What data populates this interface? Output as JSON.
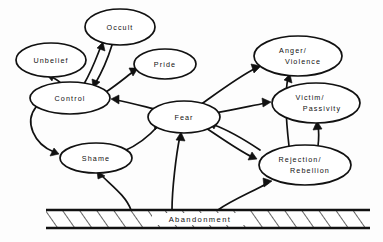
{
  "diagram": {
    "type": "directed-graph",
    "colors": {
      "stroke": "#111111",
      "fill": "#ffffff",
      "background": "#fdfdfd"
    },
    "foundation": {
      "label": "Abandonment",
      "style": "hatched-bar"
    },
    "nodes": [
      {
        "id": "occult",
        "label": "Occult",
        "lines": [
          "Occult"
        ],
        "cx": 120,
        "cy": 27,
        "rx": 35,
        "ry": 18
      },
      {
        "id": "unbelief",
        "label": "Unbelief",
        "lines": [
          "Unbelief"
        ],
        "cx": 51,
        "cy": 60,
        "rx": 35,
        "ry": 17
      },
      {
        "id": "pride",
        "label": "Pride",
        "lines": [
          "Pride"
        ],
        "cx": 165,
        "cy": 64,
        "rx": 31,
        "ry": 15
      },
      {
        "id": "control",
        "label": "Control",
        "lines": [
          "Control"
        ],
        "cx": 70,
        "cy": 98,
        "rx": 40,
        "ry": 16
      },
      {
        "id": "anger",
        "label": "Anger/Violence",
        "lines": [
          "Anger/",
          "Violence"
        ],
        "cx": 298,
        "cy": 56,
        "rx": 44,
        "ry": 20
      },
      {
        "id": "fear",
        "label": "Fear",
        "lines": [
          "Fear"
        ],
        "cx": 184,
        "cy": 117,
        "rx": 36,
        "ry": 16
      },
      {
        "id": "victim",
        "label": "Victim/Passivity",
        "lines": [
          "Victim/",
          "Passivity"
        ],
        "cx": 316,
        "cy": 103,
        "rx": 44,
        "ry": 20
      },
      {
        "id": "shame",
        "label": "Shame",
        "lines": [
          "Shame"
        ],
        "cx": 96,
        "cy": 158,
        "rx": 36,
        "ry": 15
      },
      {
        "id": "rejection",
        "label": "Rejection/Rebellion",
        "lines": [
          "Rejection/",
          "Rebellion"
        ],
        "cx": 305,
        "cy": 165,
        "rx": 46,
        "ry": 20
      }
    ],
    "edges": [
      {
        "from": "control",
        "to": "occult",
        "label": "Control to Occult"
      },
      {
        "from": "occult",
        "to": "control",
        "label": "Occult to Control"
      },
      {
        "from": "control",
        "to": "unbelief",
        "label": "Control to Unbelief"
      },
      {
        "from": "control",
        "to": "pride",
        "label": "Control to Pride"
      },
      {
        "from": "control",
        "to": "shame",
        "label": "Control to Shame"
      },
      {
        "from": "fear",
        "to": "control",
        "label": "Fear to Control"
      },
      {
        "from": "fear",
        "to": "anger",
        "label": "Fear to Anger/Violence"
      },
      {
        "from": "fear",
        "to": "victim",
        "label": "Fear to Victim/Passivity"
      },
      {
        "from": "fear",
        "to": "rejection",
        "label": "Fear to Rejection/Rebellion"
      },
      {
        "from": "rejection",
        "to": "fear",
        "label": "Rejection/Rebellion to Fear"
      },
      {
        "from": "rejection",
        "to": "anger",
        "label": "Rejection/Rebellion to Anger/Violence"
      },
      {
        "from": "rejection",
        "to": "victim",
        "label": "Rejection/Rebellion to Victim/Passivity"
      },
      {
        "from": "shame",
        "to": "fear",
        "label": "Shame to Fear"
      },
      {
        "from": "abandonment",
        "to": "shame",
        "label": "Abandonment to Shame"
      },
      {
        "from": "abandonment",
        "to": "fear",
        "label": "Abandonment to Fear"
      },
      {
        "from": "abandonment",
        "to": "rejection",
        "label": "Abandonment to Rejection/Rebellion"
      }
    ]
  }
}
